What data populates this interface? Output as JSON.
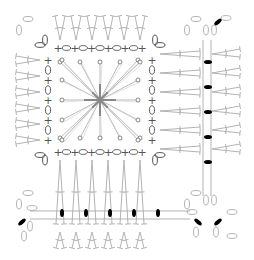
{
  "diagram": {
    "type": "crochet-chart",
    "colors": {
      "stitch": "#aaaaaa",
      "symbol": "#555555",
      "center": "#888888",
      "slip_stitch_fill": "#000000"
    },
    "legend_symbols": {
      "single_crochet": "+",
      "chain": "0",
      "slip_stitch": "black-oval",
      "double_crochet": "dc-post",
      "chain_loop": "oval"
    },
    "center": {
      "spokes": 24,
      "ring_points_per_side": 5
    },
    "inner_border": {
      "top": [
        "+",
        "0",
        "+",
        "0",
        "+",
        "0",
        "+",
        "0",
        "+",
        "0",
        "+"
      ],
      "bottom": [
        "+",
        "0",
        "+",
        "0",
        "+",
        "0",
        "+",
        "0",
        "+",
        "0",
        "+"
      ],
      "left": [
        "+",
        "0",
        "+",
        "0",
        "+",
        "0",
        "+",
        "0",
        "+"
      ],
      "right": [
        "+",
        "0",
        "+",
        "0",
        "+",
        "0",
        "+",
        "0",
        "+"
      ]
    },
    "outer_fans": {
      "top": 6,
      "left": 6,
      "bottom": 6,
      "right": 6
    },
    "seam_vertical_slip_stitches": 5,
    "seam_horizontal_slip_stitches": 5,
    "corner_join_slip_stitches": 4
  }
}
